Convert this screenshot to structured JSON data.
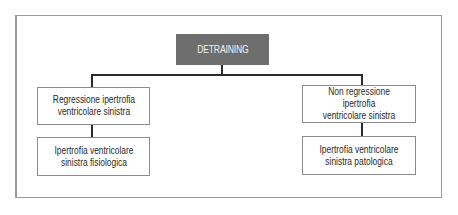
{
  "diagram": {
    "type": "tree",
    "root": {
      "label": "DETRAINING",
      "fill": "#6e6e6e",
      "text_color": "#f2f2f2"
    },
    "branches": [
      {
        "side": "left",
        "level1": "Regressione ipertrofia\nventricolare sinistra",
        "level2": "Ipertrofia ventricolare\nsinistra fisiologica"
      },
      {
        "side": "right",
        "level1": "Non regressione ipertrofia\nventricolare sinistra",
        "level2": "Ipertrofia ventricolare\nsinistra patologica"
      }
    ],
    "colors": {
      "frame_border": "#9a9a9a",
      "node_border": "#8c8c8c",
      "connector": "#2b2b2b",
      "background": "#ffffff"
    }
  }
}
